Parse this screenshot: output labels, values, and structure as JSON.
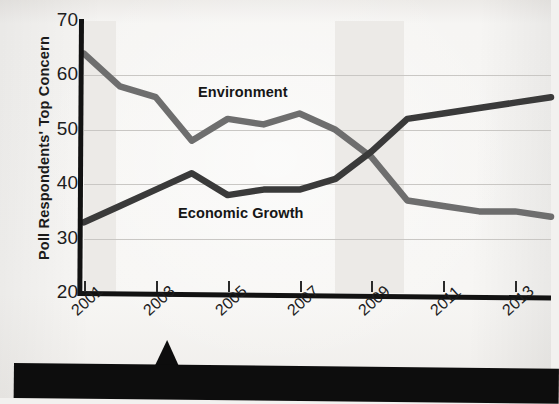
{
  "chart_data": {
    "type": "line",
    "title": "",
    "xlabel": "",
    "ylabel": "Poll Respondents' Top Concern",
    "ylim": [
      20,
      70
    ],
    "yticks": [
      20,
      30,
      40,
      50,
      60,
      70
    ],
    "xlim": [
      2001,
      2014
    ],
    "xticks": [
      2001,
      2003,
      2005,
      2007,
      2009,
      2011,
      2013
    ],
    "x": [
      2001,
      2002,
      2003,
      2004,
      2005,
      2006,
      2007,
      2008,
      2009,
      2010,
      2011,
      2012,
      2013,
      2014
    ],
    "grid": true,
    "legend_position": "inline-labels",
    "shaded_bands": [
      {
        "start": 2001.0,
        "end": 2001.9
      },
      {
        "start": 2008.0,
        "end": 2009.9
      }
    ],
    "series": [
      {
        "name": "Environment",
        "color": "#6e6e6e",
        "values": [
          64,
          58,
          56,
          48,
          52,
          51,
          53,
          50,
          45,
          37,
          36,
          35,
          35,
          34
        ]
      },
      {
        "name": "Economic Growth",
        "color": "#3a3a3a",
        "values": [
          33,
          36,
          39,
          42,
          38,
          39,
          39,
          41,
          46,
          52,
          53,
          54,
          55,
          56
        ]
      }
    ]
  },
  "axis": {
    "y_title": "Poll Respondents' Top Concern",
    "y_tick_labels": [
      "70",
      "60",
      "50",
      "40",
      "30",
      "20"
    ],
    "x_tick_labels": [
      "2001",
      "2003",
      "2005",
      "2007",
      "2009",
      "2011",
      "2013"
    ]
  },
  "series_labels": {
    "environment": "Environment",
    "economic_growth": "Economic Growth"
  },
  "colors": {
    "environment_line": "#6e6e6e",
    "economic_growth_line": "#3a3a3a",
    "axis": "#121212",
    "band": "#eceae7",
    "banner": "#0d0d0d",
    "paper": "#f5f4f2"
  }
}
